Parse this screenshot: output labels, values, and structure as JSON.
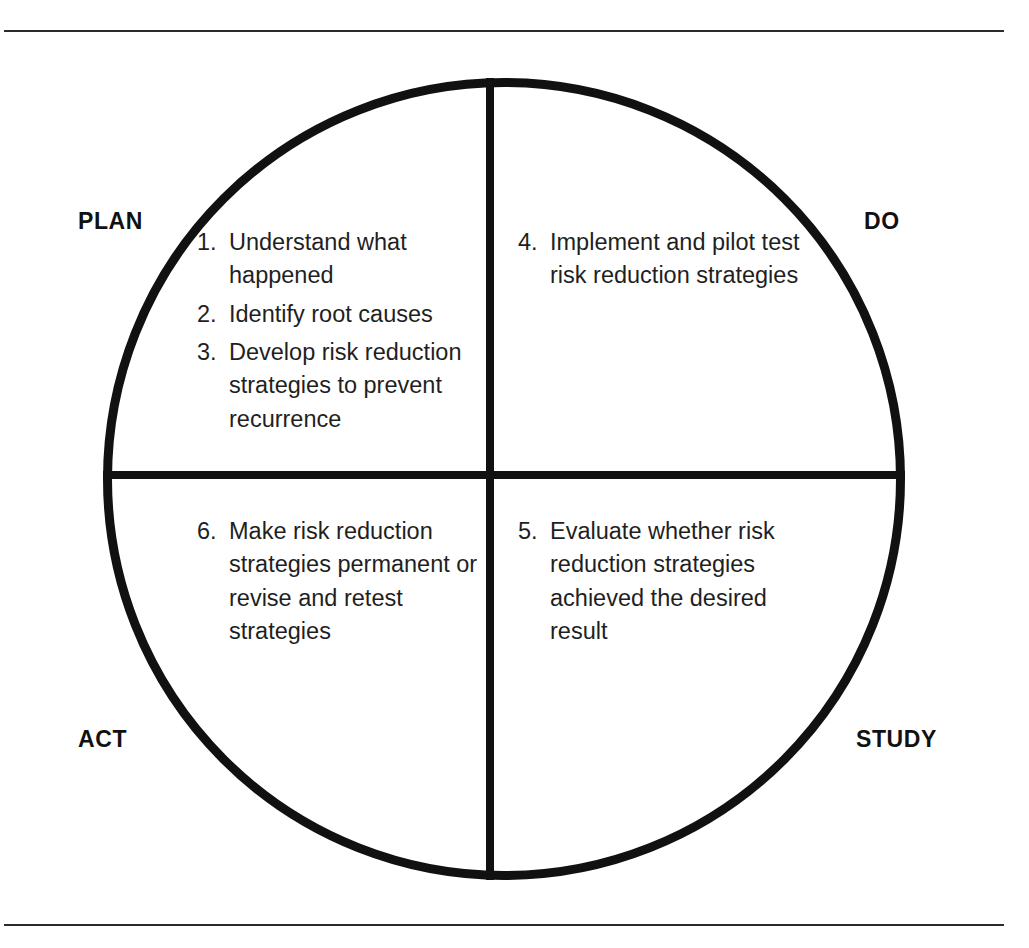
{
  "diagram": {
    "frame": {
      "top_rule": "",
      "bottom_rule": ""
    },
    "circle": {
      "stroke_color": "#111111"
    },
    "quadrants": [
      {
        "key": "plan",
        "label": "PLAN",
        "position": "top-left",
        "items": [
          {
            "number": "1.",
            "text": "Understand what happened"
          },
          {
            "number": "2.",
            "text": "Identify root causes"
          },
          {
            "number": "3.",
            "text": "Develop risk reduction strategies to prevent recurrence"
          }
        ]
      },
      {
        "key": "do",
        "label": "DO",
        "position": "top-right",
        "items": [
          {
            "number": "4.",
            "text": "Implement and pilot test risk reduction strategies"
          }
        ]
      },
      {
        "key": "act",
        "label": "ACT",
        "position": "bottom-left",
        "items": [
          {
            "number": "6.",
            "text": "Make risk reduction strategies permanent or revise and retest strategies"
          }
        ]
      },
      {
        "key": "study",
        "label": "STUDY",
        "position": "bottom-right",
        "items": [
          {
            "number": "5.",
            "text": "Evaluate whether risk reduction strategies achieved the desired result"
          }
        ]
      }
    ]
  }
}
